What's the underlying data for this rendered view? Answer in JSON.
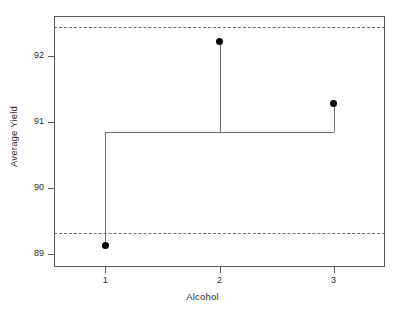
{
  "chart_data": {
    "type": "line",
    "title": "",
    "subtitle": "",
    "xlabel": "Alcohol",
    "ylabel": "Average Yield",
    "categories": [
      "1",
      "2",
      "3"
    ],
    "x": [
      1,
      2,
      3
    ],
    "values": [
      89.12,
      92.22,
      91.27
    ],
    "series": [
      {
        "name": "Average Yield",
        "values": [
          89.12,
          92.22,
          91.27
        ]
      }
    ],
    "xlim": [
      0.55,
      3.45
    ],
    "ylim": [
      88.8,
      92.6
    ],
    "x_ticks": [
      "1",
      "2",
      "3"
    ],
    "x_tick_values": [
      1,
      2,
      3
    ],
    "y_ticks": [
      "89",
      "90",
      "91",
      "92"
    ],
    "y_tick_values": [
      89,
      90,
      91,
      92
    ],
    "grid": false,
    "legend": "none",
    "annotations": [
      {
        "name": "upper-decision-limit",
        "value": 92.44,
        "style": "dashed"
      },
      {
        "name": "center-line",
        "value": 90.85,
        "style": "solid"
      },
      {
        "name": "lower-decision-limit",
        "value": 89.32,
        "style": "dashed"
      }
    ],
    "colors": {
      "point": "#000000",
      "line": "#6e6e6e",
      "limit": "#6e6e6e",
      "axis": "#5a5a5a",
      "text": "#2b2b2b",
      "background": "#ffffff"
    }
  }
}
